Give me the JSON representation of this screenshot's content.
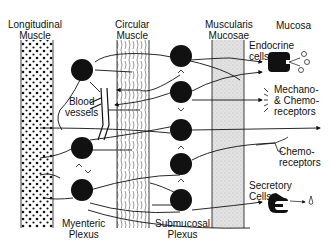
{
  "diagram": {
    "type": "enteric-nervous-system-schematic",
    "layers": [
      {
        "id": "longitudinal",
        "label_line1": "Longitudinal",
        "label_line2": "Muscle"
      },
      {
        "id": "circular",
        "label_line1": "Circular",
        "label_line2": "Muscle"
      },
      {
        "id": "muscularis",
        "label_line1": "Muscularis",
        "label_line2": "Mucosae"
      },
      {
        "id": "mucosa",
        "label_line1": "Mucosa"
      }
    ],
    "plexuses": {
      "myenteric": {
        "line1": "Myenteric",
        "line2": "Plexus"
      },
      "submucosal": {
        "line1": "Submucosal",
        "line2": "Plexus"
      }
    },
    "annotations": {
      "blood_vessels": {
        "line1": "Blood",
        "line2": "vessels"
      },
      "endocrine": {
        "line1": "Endocrine",
        "line2": "cells"
      },
      "mechano": {
        "line1": "Mechano-",
        "line2": "& Chemo-",
        "line3": "receptors"
      },
      "chemo": {
        "line1": "Chemo-",
        "line2": "receptors"
      },
      "secretory": {
        "line1": "Secretory",
        "line2": "Cells"
      }
    },
    "colors": {
      "ink": "#111111",
      "muscularis_fill": "#d8d8d8",
      "background": "#ffffff"
    }
  }
}
